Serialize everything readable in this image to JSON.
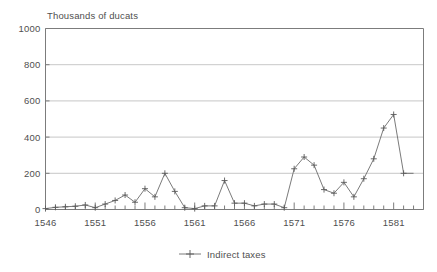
{
  "chart": {
    "axis_title": "Thousands of ducats",
    "y_ticks": [
      "0",
      "200",
      "400",
      "600",
      "800",
      "1000"
    ],
    "x_ticks": [
      "1546",
      "1551",
      "1556",
      "1561",
      "1566",
      "1571",
      "1576",
      "1581"
    ],
    "legend": {
      "series_label": "Indirect taxes",
      "marker": "plus-marker"
    },
    "colors": {
      "line": "#6b6b6b",
      "grid": "#b9b9b9",
      "axis": "#7c7c7c",
      "text": "#4f4f4f",
      "background": "#ffffff"
    }
  },
  "chart_data": {
    "type": "line",
    "title": "Thousands of ducats",
    "xlabel": "",
    "ylabel": "Thousands of ducats",
    "xlim": [
      1546,
      1584
    ],
    "ylim": [
      0,
      1000
    ],
    "grid": true,
    "legend_position": "bottom-center",
    "yticks": [
      0,
      200,
      400,
      600,
      800,
      1000
    ],
    "xticks": [
      1546,
      1551,
      1556,
      1561,
      1566,
      1571,
      1576,
      1581
    ],
    "x": [
      1546,
      1547,
      1548,
      1549,
      1550,
      1551,
      1552,
      1553,
      1554,
      1555,
      1556,
      1557,
      1558,
      1559,
      1560,
      1561,
      1562,
      1563,
      1564,
      1565,
      1566,
      1567,
      1568,
      1569,
      1570,
      1571,
      1572,
      1573,
      1574,
      1575,
      1576,
      1577,
      1578,
      1579,
      1580,
      1581,
      1582,
      1583
    ],
    "series": [
      {
        "name": "Indirect taxes",
        "marker": "plus",
        "values": [
          5,
          12,
          15,
          18,
          25,
          10,
          30,
          50,
          80,
          40,
          115,
          70,
          200,
          100,
          10,
          5,
          20,
          20,
          160,
          35,
          35,
          20,
          30,
          30,
          10,
          225,
          290,
          245,
          110,
          90,
          150,
          70,
          170,
          280,
          450,
          525,
          200,
          200
        ]
      }
    ]
  }
}
